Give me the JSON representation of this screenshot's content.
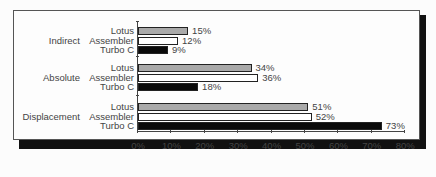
{
  "chart_data": {
    "type": "bar",
    "orientation": "horizontal",
    "title": "",
    "xlabel": "",
    "ylabel": "",
    "xlim": [
      0,
      80
    ],
    "x_ticks": [
      "0%",
      "10%",
      "20%",
      "30%",
      "40%",
      "50%",
      "60%",
      "70%",
      "80%"
    ],
    "categories": [
      "Indirect",
      "Absolute",
      "Displacement"
    ],
    "series": [
      {
        "name": "Lotus",
        "color": "#a9a9a9",
        "values": [
          15,
          34,
          51
        ]
      },
      {
        "name": "Assembler",
        "color": "#ffffff",
        "values": [
          12,
          36,
          52
        ]
      },
      {
        "name": "Turbo C",
        "color": "#0a0a0a",
        "values": [
          9,
          18,
          73
        ]
      }
    ],
    "value_labels": {
      "Indirect": {
        "Lotus": "15%",
        "Assembler": "12%",
        "Turbo C": "9%"
      },
      "Absolute": {
        "Lotus": "34%",
        "Assembler": "36%",
        "Turbo C": "18%"
      },
      "Displacement": {
        "Lotus": "51%",
        "Assembler": "52%",
        "Turbo C": "73%"
      }
    },
    "grid": false,
    "legend": "none (series labels shown per bar on y-axis)"
  },
  "groups": [
    {
      "label": "Indirect",
      "rows": [
        {
          "series": "Lotus",
          "value": 15,
          "label": "15%"
        },
        {
          "series": "Assembler",
          "value": 12,
          "label": "12%"
        },
        {
          "series": "Turbo C",
          "value": 9,
          "label": "9%"
        }
      ]
    },
    {
      "label": "Absolute",
      "rows": [
        {
          "series": "Lotus",
          "value": 34,
          "label": "34%"
        },
        {
          "series": "Assembler",
          "value": 36,
          "label": "36%"
        },
        {
          "series": "Turbo C",
          "value": 18,
          "label": "18%"
        }
      ]
    },
    {
      "label": "Displacement",
      "rows": [
        {
          "series": "Lotus",
          "value": 51,
          "label": "51%"
        },
        {
          "series": "Assembler",
          "value": 52,
          "label": "52%"
        },
        {
          "series": "Turbo C",
          "value": 73,
          "label": "73%"
        }
      ]
    }
  ],
  "x_ticks": [
    "0%",
    "10%",
    "20%",
    "30%",
    "40%",
    "50%",
    "60%",
    "70%",
    "80%"
  ]
}
